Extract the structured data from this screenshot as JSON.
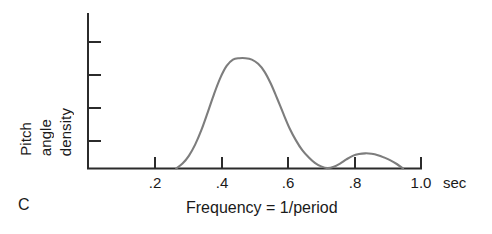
{
  "figure": {
    "panel_label": "C",
    "axis_color": "#2b2b2b",
    "curve_color": "#7d7d7d",
    "background": "#ffffff"
  },
  "chart_data": {
    "type": "line",
    "title": "",
    "subtitle": "",
    "panel": "C",
    "xlabel": "Frequency = 1/period",
    "xunit": "sec",
    "ylabel": "Pitch angle density",
    "ylabel_lines": [
      "Pitch",
      "angle",
      "density"
    ],
    "xlim": [
      0.0,
      1.06
    ],
    "ylim": [
      0,
      1.0
    ],
    "grid": false,
    "legend": null,
    "xticks": [
      0.2,
      0.4,
      0.6,
      0.8,
      1.0
    ],
    "xtick_labels": [
      ".2",
      ".4",
      ".6",
      ".8",
      "1.0"
    ],
    "yticks": [
      0.2,
      0.4,
      0.6,
      0.8
    ],
    "ytick_labels": [
      "",
      "",
      "",
      ""
    ],
    "annotations": [
      {
        "text": "main mode peak",
        "x": 0.5,
        "y": 0.78
      },
      {
        "text": "secondary mode peak",
        "x": 0.88,
        "y": 0.105
      }
    ],
    "series": [
      {
        "name": "pitch angle density",
        "color": "#7d7d7d",
        "x": [
          0.28,
          0.3,
          0.32,
          0.34,
          0.36,
          0.38,
          0.4,
          0.42,
          0.44,
          0.46,
          0.48,
          0.5,
          0.52,
          0.54,
          0.56,
          0.58,
          0.6,
          0.62,
          0.64,
          0.66,
          0.68,
          0.7,
          0.72,
          0.74,
          0.76,
          0.78,
          0.8,
          0.82,
          0.84,
          0.86,
          0.88,
          0.9,
          0.92,
          0.94,
          0.96,
          0.98,
          1.0
        ],
        "y": [
          0.0,
          0.035,
          0.09,
          0.17,
          0.275,
          0.4,
          0.53,
          0.645,
          0.73,
          0.775,
          0.785,
          0.785,
          0.775,
          0.745,
          0.69,
          0.605,
          0.5,
          0.39,
          0.285,
          0.2,
          0.13,
          0.08,
          0.04,
          0.015,
          0.003,
          0.012,
          0.035,
          0.065,
          0.09,
          0.103,
          0.108,
          0.105,
          0.095,
          0.078,
          0.058,
          0.032,
          0.0
        ]
      }
    ]
  }
}
